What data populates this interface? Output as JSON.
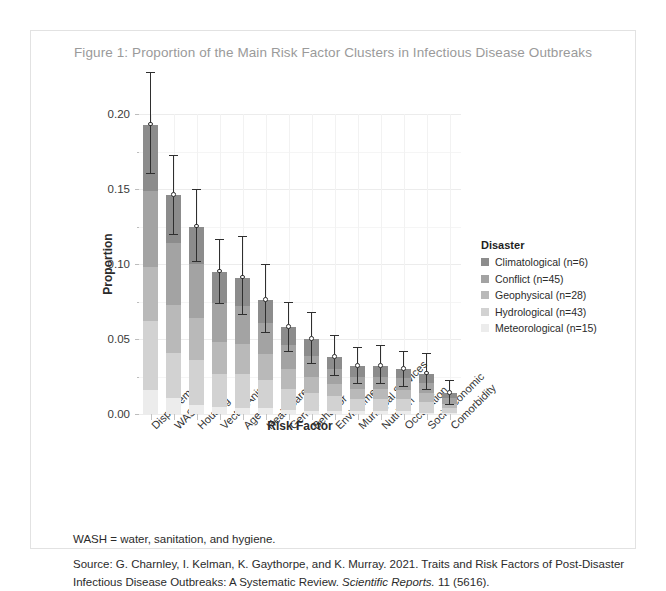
{
  "figure": {
    "title": "Figure 1: Proportion of the Main Risk Factor Clusters in Infectious Disease Outbreaks",
    "note": "WASH = water, sanitation, and hygiene.",
    "source_prefix": "Source: G. Charnley, I. Kelman, K. Gaythorpe, and K. Murray. 2021. Traits and Risk Factors of Post-Disaster Infectious Disease Outbreaks: A Systematic Review. ",
    "source_journal": "Scientific Reports.",
    "source_suffix": " 11 (5616)."
  },
  "legend": {
    "title": "Disaster",
    "items": [
      {
        "label": "Climatological (n=6)",
        "color": "#8c8c8c"
      },
      {
        "label": "Conflict (n=45)",
        "color": "#a3a3a3"
      },
      {
        "label": "Geophysical (n=28)",
        "color": "#b9b9b9"
      },
      {
        "label": "Hydrological (n=43)",
        "color": "#d2d2d2"
      },
      {
        "label": "Meteorological (n=15)",
        "color": "#ececec"
      }
    ]
  },
  "chart_data": {
    "type": "bar",
    "title": "Figure 1: Proportion of the Main Risk Factor Clusters in Infectious Disease Outbreaks",
    "xlabel": "Risk Factor",
    "ylabel": "Proportion",
    "ylim": [
      0.0,
      0.2
    ],
    "yticks": [
      0.0,
      0.05,
      0.1,
      0.15,
      0.2
    ],
    "ytick_labels": [
      "0.00",
      "0.05",
      "0.10",
      "0.15",
      "0.20"
    ],
    "grid": true,
    "legend_position": "right",
    "stacked": true,
    "categories": [
      "Displacement",
      "WASH",
      "Housing",
      "Vector/Animal",
      "Age",
      "Healthcare",
      "Gender",
      "Behavior",
      "Environment",
      "Municipal Services",
      "Nutrition",
      "Occupation",
      "Socioeconomic",
      "Comorbidity"
    ],
    "series": [
      {
        "name": "Meteorological (n=15)",
        "color": "#ececec",
        "values": [
          0.016,
          0.011,
          0.006,
          0.005,
          0.004,
          0.004,
          0.003,
          0.002,
          0.002,
          0.002,
          0.002,
          0.002,
          0.001,
          0.001
        ]
      },
      {
        "name": "Hydrological (n=43)",
        "color": "#d2d2d2",
        "values": [
          0.046,
          0.03,
          0.03,
          0.022,
          0.023,
          0.019,
          0.014,
          0.012,
          0.01,
          0.008,
          0.008,
          0.008,
          0.007,
          0.003
        ]
      },
      {
        "name": "Geophysical (n=28)",
        "color": "#b9b9b9",
        "values": [
          0.036,
          0.032,
          0.028,
          0.021,
          0.02,
          0.017,
          0.013,
          0.011,
          0.008,
          0.007,
          0.007,
          0.006,
          0.006,
          0.003
        ]
      },
      {
        "name": "Conflict (n=45)",
        "color": "#a3a3a3",
        "values": [
          0.051,
          0.041,
          0.036,
          0.026,
          0.025,
          0.021,
          0.016,
          0.014,
          0.01,
          0.008,
          0.008,
          0.008,
          0.007,
          0.004
        ]
      },
      {
        "name": "Climatological (n=6)",
        "color": "#8c8c8c",
        "values": [
          0.044,
          0.032,
          0.025,
          0.021,
          0.019,
          0.015,
          0.012,
          0.011,
          0.008,
          0.007,
          0.007,
          0.006,
          0.006,
          0.003
        ]
      }
    ],
    "totals": [
      0.193,
      0.146,
      0.125,
      0.095,
      0.091,
      0.076,
      0.058,
      0.05,
      0.038,
      0.032,
      0.032,
      0.03,
      0.027,
      0.014
    ],
    "error_bars": {
      "lower": [
        0.161,
        0.12,
        0.102,
        0.074,
        0.067,
        0.055,
        0.042,
        0.034,
        0.026,
        0.021,
        0.021,
        0.019,
        0.017,
        0.007
      ],
      "upper": [
        0.228,
        0.173,
        0.15,
        0.117,
        0.119,
        0.1,
        0.075,
        0.068,
        0.053,
        0.045,
        0.046,
        0.042,
        0.041,
        0.023
      ]
    }
  }
}
